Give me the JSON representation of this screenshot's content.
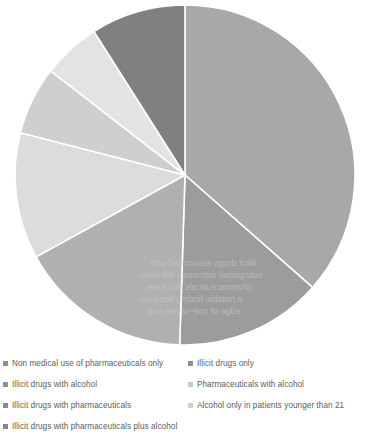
{
  "chart_data": {
    "type": "pie",
    "title": "",
    "labels": [
      "Non medical use of pharmaceuticals only",
      "Illicit drugs only",
      "Illicit drugs with alcohol",
      "Pharmaceuticals with alcohol",
      "Illicit drugs with pharmaceuticals",
      "Alcohol only in patients younger than 21",
      "Illicit drugs with pharmaceuticals plus alcohol"
    ],
    "values": [
      36.5,
      14.0,
      16.5,
      12.0,
      6.5,
      5.5,
      9.0
    ],
    "colors": [
      "#a8a8a8",
      "#9c9c9c",
      "#b0b0b0",
      "#dcdcdc",
      "#cfcfcf",
      "#e3e3e3",
      "#808080"
    ],
    "start_angle_deg": 0,
    "direction": "clockwise",
    "legend_position": "bottom",
    "grid": false,
    "xlabel": "",
    "ylabel": ""
  },
  "legend": {
    "columns": [
      {
        "items": [
          {
            "label": "Non medical use of pharmaceuticals only",
            "color": "#8f8f8f"
          },
          {
            "label": "Illicit drugs with alcohol",
            "color": "#8f8f8f"
          },
          {
            "label": "Illicit drugs with pharmaceuticals",
            "color": "#8a8a8a"
          },
          {
            "label": "Illicit drugs with pharmaceuticals plus alcohol",
            "color": "#858585"
          }
        ]
      },
      {
        "items": [
          {
            "label": "Illicit drugs only",
            "color": "#8f8f8f"
          },
          {
            "label": "Pharmaceuticals with alcohol",
            "color": "#c9c9c9"
          },
          {
            "label": "Alcohol only in patients younger than 21",
            "color": "#d2d2d2"
          }
        ]
      }
    ]
  },
  "pie_geometry": {
    "center_x": 185,
    "center_y": 175,
    "radius": 170,
    "separator_color": "#ffffff",
    "separator_width": 1.6
  },
  "background_text": {
    "lines": [
      "Illicit drugs associated with",
      "suboptimal outcomes still have",
      "pharmaceuticals that have",
      "a notable finding because",
      "edge of one-seven-and"
    ]
  }
}
